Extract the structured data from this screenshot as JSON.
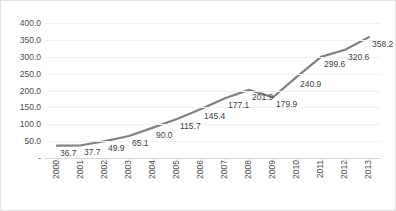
{
  "chart_data": {
    "type": "line",
    "title": "",
    "xlabel": "",
    "ylabel": "",
    "categories": [
      "2000",
      "2001",
      "2002",
      "2003",
      "2004",
      "2005",
      "2006",
      "2007",
      "2008",
      "2009",
      "2010",
      "2011",
      "2012",
      "2013"
    ],
    "values": [
      36.7,
      37.7,
      49.9,
      65.1,
      90.0,
      115.7,
      145.4,
      177.1,
      201.9,
      179.9,
      240.9,
      299.6,
      320.6,
      358.2
    ],
    "data_labels": [
      "36.7",
      "37.7",
      "49.9",
      "65.1",
      "90.0",
      "115.7",
      "145.4",
      "177.1",
      "201.9",
      "179.9",
      "240.9",
      "299.6",
      "320.6",
      "358.2"
    ],
    "ylim": [
      0,
      400
    ],
    "ytick_values": [
      400,
      350,
      300,
      250,
      200,
      150,
      100,
      50,
      0
    ],
    "ytick_labels": [
      "400.0",
      "350.0",
      "300.0",
      "250.0",
      "200.0",
      "150.0",
      "100.0",
      "50.0",
      "-"
    ],
    "grid": true,
    "legend": false,
    "legend_position": "none",
    "series_color": "#808080",
    "gridline_color": "#f0f0f0",
    "axis_color": "#d9d9d9",
    "text_color": "#4d4d4d",
    "label_rotation": 90
  }
}
